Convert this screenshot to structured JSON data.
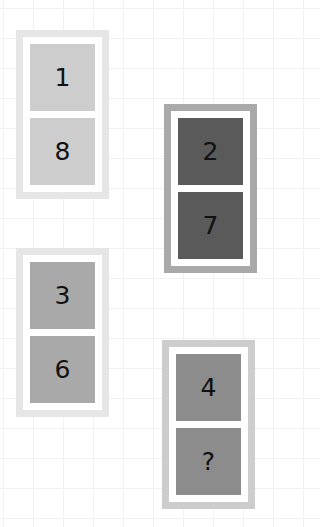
{
  "puzzle": {
    "cards": [
      {
        "id": 1,
        "top_value": "1",
        "bottom_value": "8",
        "border_color": "#e6e6e6",
        "tile_color": "#cdcdcd",
        "x": 16,
        "y": 30
      },
      {
        "id": 2,
        "top_value": "2",
        "bottom_value": "7",
        "border_color": "#a9a9a9",
        "tile_color": "#5a5a5a",
        "x": 164,
        "y": 104
      },
      {
        "id": 3,
        "top_value": "3",
        "bottom_value": "6",
        "border_color": "#e6e6e6",
        "tile_color": "#a9a9a9",
        "x": 16,
        "y": 248
      },
      {
        "id": 4,
        "top_value": "4",
        "bottom_value": "?",
        "border_color": "#cdcdcd",
        "tile_color": "#8c8c8c",
        "x": 162,
        "y": 340
      }
    ]
  }
}
